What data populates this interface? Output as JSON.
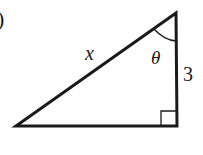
{
  "figure": {
    "partial_label": ")",
    "triangle": {
      "hypotenuse_label": "x",
      "angle_label": "θ",
      "vertical_side_label": "3",
      "right_angle": true
    },
    "colors": {
      "stroke": "#1a1a1a",
      "background": "#ffffff"
    }
  }
}
